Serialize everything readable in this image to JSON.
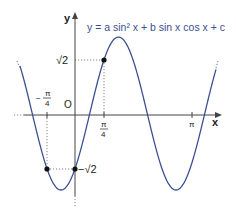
{
  "diagram": {
    "type": "function-graph",
    "equation": "y = a sin² x + b sin x cos x + c",
    "axes": {
      "x_label": "x",
      "y_label": "y",
      "origin_label": "O"
    },
    "x_ticks": [
      {
        "label_num": "π",
        "label_den": "4",
        "sign": "−",
        "value": "-π/4"
      },
      {
        "label_num": "π",
        "label_den": "4",
        "sign": "",
        "value": "π/4"
      },
      {
        "label": "π",
        "value": "π"
      }
    ],
    "y_ticks": [
      {
        "label": "√2",
        "value": "√2"
      },
      {
        "label": "−√2",
        "value": "-√2"
      }
    ],
    "marked_points": [
      {
        "x": "π/4",
        "y": "√2"
      },
      {
        "x": "0",
        "y": "-√2"
      },
      {
        "x": "-π/4",
        "y": "-√2"
      }
    ],
    "colors": {
      "curve": "#3d4f8f",
      "axis": "#444444",
      "guide": "#666666",
      "equation": "#3d4f8f"
    }
  }
}
